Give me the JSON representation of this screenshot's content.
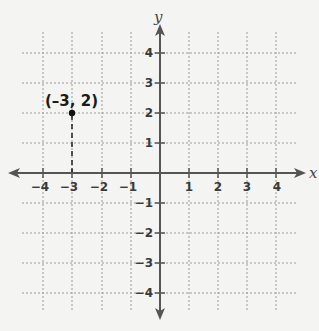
{
  "figure": {
    "type": "coordinate-plane",
    "x_axis_label": "x",
    "y_axis_label": "y",
    "x_range": [
      -4,
      4
    ],
    "y_range": [
      -4,
      4
    ],
    "x_tick_labels": [
      "−4",
      "−3",
      "−2",
      "−1",
      "1",
      "2",
      "3",
      "4"
    ],
    "y_tick_labels": [
      "4",
      "3",
      "2",
      "1",
      "−1",
      "−2",
      "−3",
      "−4"
    ],
    "grid": "dotted",
    "point": {
      "x": -3,
      "y": 2,
      "label": "(–3, 2)"
    },
    "guide_line": "dashed vertical from point to x-axis"
  },
  "colors": {
    "background": "#f4f4f2",
    "axis": "#555555",
    "grid": "#9a9a9a",
    "point": "#111111"
  }
}
